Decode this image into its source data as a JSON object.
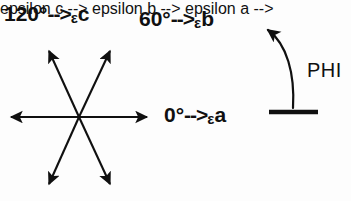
{
  "figure": {
    "background_color": "#fdfdfd",
    "ink_color": "#101010",
    "width": 351,
    "height": 201
  },
  "labels": {
    "axis_c": {
      "angle": "120°",
      "arrow": "-->",
      "epsilon": "ε",
      "name": "c",
      "full_text": "120° -->εc"
    },
    "axis_b": {
      "angle": "60°",
      "arrow": "-->",
      "epsilon": "ε",
      "name": "b",
      "full_text": "60° -->εb"
    },
    "axis_a": {
      "angle": "0°",
      "arrow": "-->",
      "epsilon": "ε",
      "name": "a",
      "full_text": "0° -->εa"
    },
    "phi": {
      "text": "PHI"
    }
  },
  "star": {
    "center_x": 79,
    "center_y": 117,
    "radius": 76,
    "arrow_count": 6,
    "axes_degrees": [
      0,
      60,
      120,
      180,
      240,
      300
    ],
    "tips": [
      {
        "name": "tip-right",
        "x": 152,
        "y": 117
      },
      {
        "name": "tip-upper-right",
        "x": 114,
        "y": 44
      },
      {
        "name": "tip-upper-left",
        "x": 45,
        "y": 44
      },
      {
        "name": "tip-left",
        "x": 6,
        "y": 117
      },
      {
        "name": "tip-lower-left",
        "x": 45,
        "y": 191
      },
      {
        "name": "tip-lower-right",
        "x": 114,
        "y": 191
      }
    ]
  },
  "phi_arc": {
    "arrowhead_x": 262,
    "arrowhead_y": 25,
    "base_x": 293,
    "base_y": 110,
    "baseline_from_x": 269,
    "baseline_to_x": 318,
    "baseline_y": 112,
    "direction": "counterclockwise-upward"
  }
}
